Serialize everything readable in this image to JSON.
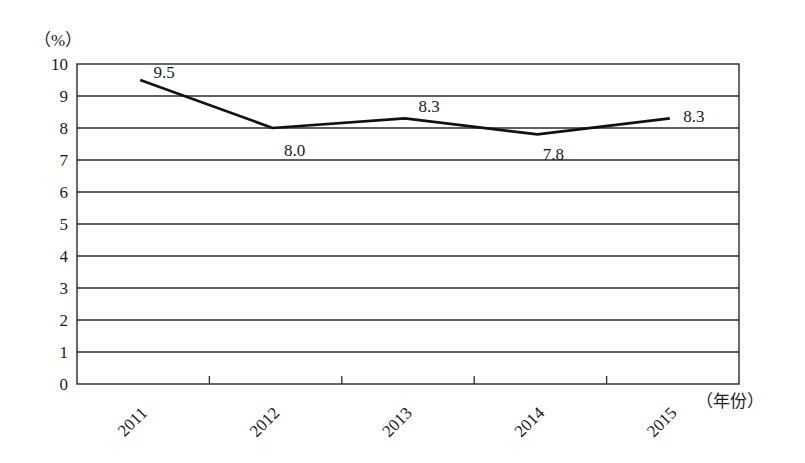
{
  "chart_data": {
    "type": "line",
    "title": "",
    "xlabel": "（年份）",
    "ylabel": "（%）",
    "categories": [
      "2011",
      "2012",
      "2013",
      "2014",
      "2015"
    ],
    "series": [
      {
        "name": "",
        "values": [
          9.5,
          8.0,
          8.3,
          7.8,
          8.3
        ]
      }
    ],
    "data_labels": [
      "9.5",
      "8.0",
      "8.3",
      "7.8",
      "8.3"
    ],
    "ylim": [
      0,
      10
    ],
    "yticks": [
      0,
      1,
      2,
      3,
      4,
      5,
      6,
      7,
      8,
      9,
      10
    ],
    "grid": true,
    "legend": null,
    "colors": {
      "line": "#111111",
      "grid": "#2a2a2a"
    }
  },
  "labels": {
    "y_unit": "（%）",
    "x_unit": "（年份）"
  }
}
